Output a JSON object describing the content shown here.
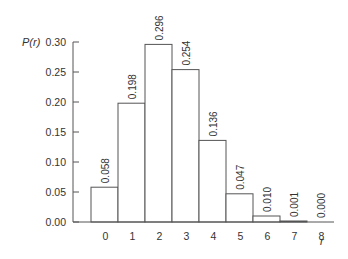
{
  "chart_data": {
    "type": "bar",
    "title": "",
    "xlabel": "r",
    "ylabel": "P(r)",
    "categories": [
      "0",
      "1",
      "2",
      "3",
      "4",
      "5",
      "6",
      "7",
      "8"
    ],
    "values": [
      0.058,
      0.198,
      0.296,
      0.254,
      0.136,
      0.047,
      0.01,
      0.001,
      0.0
    ],
    "value_labels": [
      "0.058",
      "0.198",
      "0.296",
      "0.254",
      "0.136",
      "0.047",
      "0.010",
      "0.001",
      "0.000"
    ],
    "ylim": [
      0,
      0.3
    ],
    "yticks": [
      0.0,
      0.05,
      0.1,
      0.15,
      0.2,
      0.25,
      0.3
    ],
    "ytick_labels": [
      "0.00",
      "0.05",
      "0.10",
      "0.15",
      "0.20",
      "0.25",
      "0.30"
    ],
    "grid": false,
    "legend": null,
    "bar_fill": "#ffffff",
    "bar_stroke": "#555555"
  }
}
